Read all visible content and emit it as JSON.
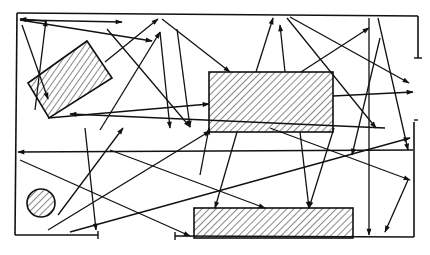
{
  "diagram": {
    "type": "ray-reflection-diagram",
    "width": 430,
    "height": 255,
    "colors": {
      "stroke": "#111111",
      "background": "#ffffff",
      "hatch": "#111111"
    },
    "walls": [
      {
        "id": "top-wall",
        "points": [
          [
            17,
            13
          ],
          [
            418,
            16
          ]
        ]
      },
      {
        "id": "top-right-stub",
        "points": [
          [
            418,
            16
          ],
          [
            418,
            58
          ]
        ]
      },
      {
        "id": "left-wall",
        "points": [
          [
            17,
            13
          ],
          [
            15,
            235
          ]
        ]
      },
      {
        "id": "bottom-left-wall",
        "points": [
          [
            15,
            235
          ],
          [
            98,
            235
          ]
        ]
      },
      {
        "id": "bottom-mid-wall",
        "points": [
          [
            175,
            236
          ],
          [
            414,
            237
          ]
        ]
      },
      {
        "id": "right-lower-wall",
        "points": [
          [
            414,
            122
          ],
          [
            414,
            237
          ]
        ]
      }
    ],
    "obstacles": [
      {
        "id": "tilted-block",
        "shape": "polygon",
        "points": [
          [
            28,
            83
          ],
          [
            87,
            41
          ],
          [
            112,
            78
          ],
          [
            49,
            118
          ]
        ]
      },
      {
        "id": "center-block",
        "shape": "rect",
        "x": 209,
        "y": 72,
        "w": 124,
        "h": 60
      },
      {
        "id": "bottom-block",
        "shape": "rect",
        "x": 194,
        "y": 208,
        "w": 159,
        "h": 30
      },
      {
        "id": "circle",
        "shape": "circle",
        "cx": 41,
        "cy": 203,
        "r": 14
      }
    ],
    "rays": [
      {
        "from": [
          45,
          21
        ],
        "to": [
          20,
          19
        ]
      },
      {
        "from": [
          20,
          20
        ],
        "to": [
          122,
          22
        ]
      },
      {
        "from": [
          22,
          25
        ],
        "to": [
          48,
          99
        ]
      },
      {
        "from": [
          35,
          110
        ],
        "to": [
          46,
          20
        ]
      },
      {
        "from": [
          20,
          20
        ],
        "to": [
          152,
          41
        ]
      },
      {
        "from": [
          107,
          29
        ],
        "to": [
          190,
          127
        ]
      },
      {
        "from": [
          105,
          62
        ],
        "to": [
          158,
          19
        ]
      },
      {
        "from": [
          100,
          130
        ],
        "to": [
          160,
          32
        ]
      },
      {
        "from": [
          160,
          32
        ],
        "to": [
          170,
          128
        ]
      },
      {
        "from": [
          177,
          29
        ],
        "to": [
          190,
          127
        ]
      },
      {
        "from": [
          162,
          19
        ],
        "to": [
          230,
          72
        ]
      },
      {
        "from": [
          256,
          72
        ],
        "to": [
          273,
          18
        ]
      },
      {
        "from": [
          285,
          72
        ],
        "to": [
          280,
          25
        ]
      },
      {
        "from": [
          301,
          72
        ],
        "to": [
          369,
          28
        ]
      },
      {
        "from": [
          290,
          17
        ],
        "to": [
          409,
          83
        ]
      },
      {
        "from": [
          287,
          18
        ],
        "to": [
          376,
          128
        ]
      },
      {
        "from": [
          369,
          18
        ],
        "to": [
          369,
          235
        ]
      },
      {
        "from": [
          380,
          38
        ],
        "to": [
          352,
          155
        ]
      },
      {
        "from": [
          378,
          18
        ],
        "to": [
          408,
          150
        ]
      },
      {
        "from": [
          333,
          96
        ],
        "to": [
          413,
          92
        ]
      },
      {
        "from": [
          48,
          118
        ],
        "to": [
          209,
          104
        ]
      },
      {
        "from": [
          385,
          128
        ],
        "to": [
          70,
          114
        ]
      },
      {
        "from": [
          413,
          150
        ],
        "to": [
          18,
          152
        ]
      },
      {
        "from": [
          20,
          160
        ],
        "to": [
          190,
          236
        ]
      },
      {
        "from": [
          58,
          215
        ],
        "to": [
          123,
          128
        ]
      },
      {
        "from": [
          70,
          232
        ],
        "to": [
          410,
          138
        ]
      },
      {
        "from": [
          48,
          230
        ],
        "to": [
          210,
          131
        ]
      },
      {
        "from": [
          85,
          128
        ],
        "to": [
          96,
          230
        ]
      },
      {
        "from": [
          200,
          175
        ],
        "to": [
          209,
          128
        ]
      },
      {
        "from": [
          237,
          132
        ],
        "to": [
          215,
          208
        ]
      },
      {
        "from": [
          300,
          132
        ],
        "to": [
          309,
          208
        ]
      },
      {
        "from": [
          334,
          128
        ],
        "to": [
          309,
          208
        ]
      },
      {
        "from": [
          270,
          128
        ],
        "to": [
          410,
          180
        ]
      },
      {
        "from": [
          110,
          150
        ],
        "to": [
          265,
          208
        ]
      },
      {
        "from": [
          408,
          180
        ],
        "to": [
          385,
          232
        ]
      }
    ]
  }
}
